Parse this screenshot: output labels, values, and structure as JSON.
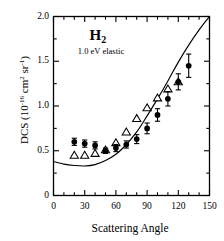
{
  "figure": {
    "annotation_molecule": "H",
    "annotation_molecule_sub": "2",
    "annotation_condition": "1.0 eV elastic",
    "background": "#ffffff",
    "foreground": "#000000"
  },
  "axes": {
    "xlabel": "Scattering Angle",
    "ylabel_main": "DCS (10",
    "ylabel_exp": "-16",
    "ylabel_mid": " cm",
    "ylabel_sup2": "2",
    "ylabel_sr": " sr",
    "ylabel_srexp": "-1",
    "ylabel_close": ")",
    "xticks": [
      "0",
      "30",
      "60",
      "90",
      "120",
      "150"
    ],
    "yticks": [
      "0",
      "0.5",
      "1.0",
      "1.5",
      "2.0"
    ]
  },
  "chart_data": {
    "type": "scatter",
    "title": "H2 1.0 eV elastic",
    "xlabel": "Scattering Angle",
    "ylabel": "DCS (10^-16 cm^2 sr^-1)",
    "xlim": [
      0,
      150
    ],
    "ylim": [
      0,
      2.0
    ],
    "xtick_major": 30,
    "xtick_minor": 10,
    "ytick_major": 0.5,
    "ytick_minor": 0.25,
    "grid": false,
    "legend": "none",
    "series": [
      {
        "name": "present experiment",
        "marker": "filled-circle",
        "has_errorbars": true,
        "x": [
          20,
          30,
          40,
          50,
          60,
          70,
          80,
          90,
          100,
          110,
          120,
          130
        ],
        "y": [
          0.6,
          0.58,
          0.56,
          0.5,
          0.53,
          0.57,
          0.63,
          0.75,
          0.9,
          1.08,
          1.27,
          1.45
        ],
        "yerr": [
          0.04,
          0.04,
          0.04,
          0.03,
          0.04,
          0.04,
          0.05,
          0.06,
          0.07,
          0.08,
          0.09,
          0.13
        ]
      },
      {
        "name": "previous measurement",
        "marker": "open-triangle",
        "has_errorbars": false,
        "x": [
          20,
          30,
          40,
          50,
          60,
          70,
          80,
          90,
          100,
          110,
          120
        ],
        "y": [
          0.45,
          0.45,
          0.47,
          0.51,
          0.59,
          0.71,
          0.86,
          0.98,
          1.09,
          1.19,
          1.27
        ]
      },
      {
        "name": "theory",
        "marker": "line",
        "x": [
          0,
          10,
          20,
          30,
          40,
          50,
          60,
          70,
          80,
          90,
          100,
          110,
          120,
          130,
          140,
          150
        ],
        "y": [
          0.38,
          0.35,
          0.335,
          0.33,
          0.345,
          0.39,
          0.46,
          0.57,
          0.71,
          0.89,
          1.08,
          1.28,
          1.49,
          1.68,
          1.85,
          2.0
        ]
      }
    ]
  }
}
